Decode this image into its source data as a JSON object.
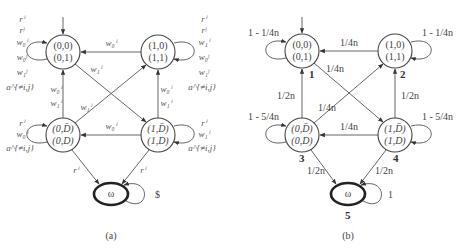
{
  "diagram_a": {
    "caption": "(a)",
    "nodes": [
      {
        "id": "a00",
        "line1": "(0,0)",
        "line2": "(0,1)"
      },
      {
        "id": "a10",
        "line1": "(1,0)",
        "line2": "(1,1)"
      },
      {
        "id": "a0D",
        "line1": "(0,D̄)",
        "line2": "(0,D)"
      },
      {
        "id": "a1D",
        "line1": "(1,D̄)",
        "line2": "(1,D)"
      },
      {
        "id": "aw",
        "line1": "ω"
      }
    ],
    "loops": {
      "a00": [
        "rⁱ",
        "rʲ",
        "w₀ⁱ",
        "w₀ʲ",
        "w₁ʲ",
        "a^{≠i,j}"
      ],
      "a10": [
        "rⁱ",
        "rʲ",
        "w₁ⁱ",
        "w₀ʲ",
        "w₁ʲ",
        "a^{≠i,j}"
      ],
      "a0D": [
        "rⁱ",
        "w₀ⁱ",
        "a^{≠i,j}"
      ],
      "a1D": [
        "rⁱ",
        "w₁ⁱ",
        "a^{≠i,j}"
      ],
      "aw": "$"
    },
    "edges": {
      "a10_to_a00": "w₀ⁱ",
      "a00_to_a1D": "w₁ⁱ",
      "a0D_to_a00": [
        "w₀ⁱ",
        "w₁ⁱ"
      ],
      "a0D_to_a10": "w₁ⁱ",
      "a1D_to_a10": [
        "w₀ⁱ",
        "w₁ⁱ"
      ],
      "a1D_to_a0D": "w₀ⁱ",
      "a0D_to_aw": "rⁱ",
      "a1D_to_aw": "rⁱ"
    }
  },
  "diagram_b": {
    "caption": "(b)",
    "nodes": [
      {
        "id": "b1",
        "line1": "(0,0)",
        "line2": "(0,1)",
        "num": "1"
      },
      {
        "id": "b2",
        "line1": "(1,0)",
        "line2": "(1,1)",
        "num": "2"
      },
      {
        "id": "b3",
        "line1": "(0,D̄)",
        "line2": "(0,D)",
        "num": "3"
      },
      {
        "id": "b4",
        "line1": "(1,D̄)",
        "line2": "(1,D)",
        "num": "4"
      },
      {
        "id": "b5",
        "line1": "ω",
        "num": "5"
      }
    ],
    "loops": {
      "b1": "1 - 1/4n",
      "b2": "1 - 1/4n",
      "b3": "1 - 5/4n",
      "b4": "1 - 5/4n",
      "b5": "1"
    },
    "edges": {
      "b2_to_b1": "1/4n",
      "b1_to_b4": "1/4n",
      "b3_to_b1": "1/2n",
      "b3_to_b2": "1/4n",
      "b4_to_b2": "1/2n",
      "b4_to_b3": "1/4n",
      "b3_to_b5": "1/2n",
      "b4_to_b5": "1/2n"
    }
  }
}
